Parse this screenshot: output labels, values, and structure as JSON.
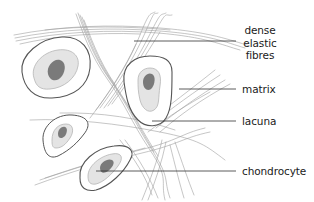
{
  "diagram": {
    "colors": {
      "background": "#ffffff",
      "fibre": "#9a9a9a",
      "lacuna_outline": "#555555",
      "matrix_halo_fill": "#e6e6e6",
      "matrix_halo_stroke": "#b5b5b5",
      "nucleus_fill": "#7a7a7a",
      "leader_line": "#333333",
      "label_text": "#1a1a1a"
    },
    "labels": [
      {
        "id": "dense-elastic-fibres",
        "text": "dense\nelastic\nfibres"
      },
      {
        "id": "matrix",
        "text": "matrix"
      },
      {
        "id": "lacuna",
        "text": "lacuna"
      },
      {
        "id": "chondrocyte",
        "text": "chondrocyte"
      }
    ]
  }
}
